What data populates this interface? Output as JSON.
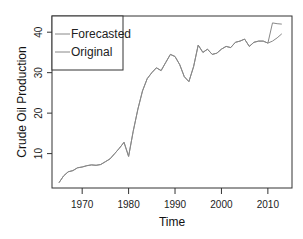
{
  "chart_data": {
    "type": "line",
    "title": "",
    "xlabel": "Time",
    "ylabel": "Crude Oil Production",
    "xlim": [
      1963.5,
      2015.2
    ],
    "ylim": [
      1.5,
      44.0
    ],
    "x_ticks": [
      1970,
      1980,
      1990,
      2000,
      2010
    ],
    "x_tick_labels": [
      "1970",
      "1980",
      "1990",
      "2000",
      "2010"
    ],
    "y_ticks": [
      10,
      20,
      30,
      40
    ],
    "y_tick_labels": [
      "10",
      "20",
      "30",
      "40"
    ],
    "grid": false,
    "legend": {
      "position": "top-left",
      "entries": [
        "Forecasted",
        "Original"
      ]
    },
    "series": [
      {
        "name": "Forecasted",
        "color": "#888888",
        "x": [
          1965,
          1966,
          1967,
          1968,
          1969,
          1970,
          1971,
          1972,
          1973,
          1974,
          1975,
          1976,
          1977,
          1978,
          1979,
          1980,
          1981,
          1982,
          1983,
          1984,
          1985,
          1986,
          1987,
          1988,
          1989,
          1990,
          1991,
          1992,
          1993,
          1994,
          1995,
          1996,
          1997,
          1998,
          1999,
          2000,
          2001,
          2002,
          2003,
          2004,
          2005,
          2006,
          2007,
          2008,
          2009,
          2010,
          2011,
          2012,
          2013
        ],
        "values": [
          2.8,
          4.5,
          5.5,
          5.8,
          6.5,
          6.7,
          7.0,
          7.2,
          7.1,
          7.3,
          8.0,
          8.7,
          10.0,
          11.3,
          12.8,
          9.3,
          15.5,
          21.0,
          25.5,
          28.5,
          30.0,
          31.2,
          30.5,
          32.5,
          34.5,
          34.0,
          32.0,
          29.0,
          27.8,
          31.5,
          36.8,
          35.0,
          35.8,
          34.5,
          34.8,
          35.8,
          36.5,
          36.2,
          37.5,
          37.8,
          38.3,
          36.5,
          37.5,
          37.8,
          37.8,
          37.3,
          42.3,
          42.1,
          42.0
        ]
      },
      {
        "name": "Original",
        "color": "#888888",
        "x": [
          1965,
          1966,
          1967,
          1968,
          1969,
          1970,
          1971,
          1972,
          1973,
          1974,
          1975,
          1976,
          1977,
          1978,
          1979,
          1980,
          1981,
          1982,
          1983,
          1984,
          1985,
          1986,
          1987,
          1988,
          1989,
          1990,
          1991,
          1992,
          1993,
          1994,
          1995,
          1996,
          1997,
          1998,
          1999,
          2000,
          2001,
          2002,
          2003,
          2004,
          2005,
          2006,
          2007,
          2008,
          2009,
          2010,
          2011,
          2012,
          2013
        ],
        "values": [
          2.8,
          4.5,
          5.5,
          5.8,
          6.5,
          6.7,
          7.0,
          7.2,
          7.1,
          7.3,
          8.0,
          8.7,
          10.0,
          11.3,
          12.8,
          9.3,
          15.5,
          21.0,
          25.5,
          28.5,
          30.0,
          31.2,
          30.5,
          32.5,
          34.5,
          34.0,
          32.0,
          29.0,
          27.8,
          31.5,
          36.8,
          35.0,
          35.8,
          34.5,
          34.8,
          35.8,
          36.5,
          36.2,
          37.5,
          37.8,
          38.3,
          36.5,
          37.5,
          37.8,
          37.8,
          37.3,
          37.8,
          38.6,
          39.6
        ]
      }
    ]
  }
}
